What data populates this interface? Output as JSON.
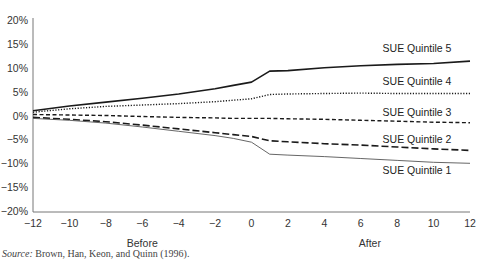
{
  "chart_data": {
    "type": "line",
    "title": "",
    "xlabel": "",
    "ylabel": "",
    "x": [
      -12,
      -10,
      -8,
      -6,
      -4,
      -2,
      -1,
      0,
      1,
      2,
      4,
      6,
      8,
      10,
      12
    ],
    "xlim": [
      -12,
      12
    ],
    "ylim": [
      -20,
      20
    ],
    "x_ticks": [
      "−12",
      "−10",
      "−8",
      "−6",
      "−4",
      "−2",
      "0",
      "2",
      "4",
      "6",
      "8",
      "10",
      "12"
    ],
    "y_ticks": [
      "20%",
      "15%",
      "10%",
      "5%",
      "0%",
      "−5%",
      "−10%",
      "−15%",
      "−20%"
    ],
    "group_labels": [
      {
        "text": "Before",
        "x": -6
      },
      {
        "text": "After",
        "x": 6.5
      }
    ],
    "grid": false,
    "legend_position": "inline-right",
    "series": [
      {
        "name": "SUE Quintile 5",
        "style": "solid",
        "width": 1.6,
        "color": "#1a1a1a",
        "values": [
          1.0,
          2.0,
          2.8,
          3.6,
          4.5,
          5.6,
          6.3,
          7.0,
          9.3,
          9.4,
          10.0,
          10.4,
          10.7,
          10.9,
          11.4
        ]
      },
      {
        "name": "SUE Quintile 4",
        "style": "dotted",
        "width": 1.4,
        "color": "#1a1a1a",
        "values": [
          0.7,
          1.4,
          1.9,
          2.2,
          2.5,
          2.9,
          3.2,
          3.5,
          4.4,
          4.5,
          4.6,
          4.7,
          4.6,
          4.6,
          4.6
        ]
      },
      {
        "name": "SUE Quintile 3",
        "style": "dashed-short",
        "width": 1.4,
        "color": "#1a1a1a",
        "values": [
          0.2,
          0.1,
          0.0,
          -0.2,
          -0.4,
          -0.5,
          -0.6,
          -0.6,
          -0.6,
          -0.7,
          -0.8,
          -1.0,
          -1.2,
          -1.4,
          -1.5
        ]
      },
      {
        "name": "SUE Quintile 2",
        "style": "dashed-long",
        "width": 1.6,
        "color": "#1a1a1a",
        "values": [
          -0.4,
          -0.8,
          -1.3,
          -2.0,
          -2.8,
          -3.6,
          -4.0,
          -4.4,
          -5.3,
          -5.5,
          -5.9,
          -6.2,
          -6.6,
          -7.0,
          -7.3
        ]
      },
      {
        "name": "SUE Quintile 1",
        "style": "solid-thin",
        "width": 0.9,
        "color": "#555555",
        "values": [
          -0.6,
          -1.0,
          -1.6,
          -2.4,
          -3.3,
          -4.2,
          -4.8,
          -5.6,
          -8.1,
          -8.3,
          -8.6,
          -9.0,
          -9.4,
          -9.8,
          -10.0
        ]
      }
    ],
    "series_label_positions": [
      {
        "name": "SUE Quintile 5",
        "x": 7.2,
        "y": 13.2
      },
      {
        "name": "SUE Quintile 4",
        "x": 7.2,
        "y": 6.3
      },
      {
        "name": "SUE Quintile 3",
        "x": 7.2,
        "y": 0.0
      },
      {
        "name": "SUE Quintile 2",
        "x": 7.2,
        "y": -5.8
      },
      {
        "name": "SUE Quintile 1",
        "x": 7.2,
        "y": -12.2
      }
    ]
  },
  "source": {
    "prefix": "Source:",
    "text": " Brown, Han, Keon, and Quinn (1996)."
  }
}
